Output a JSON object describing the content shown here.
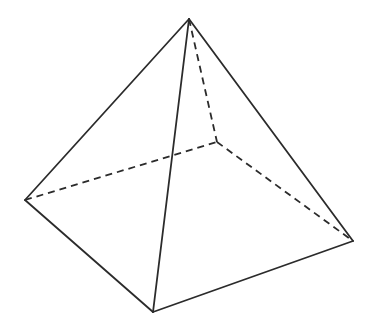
{
  "diagram": {
    "stroke_color": "#2b2b2b",
    "background": "#ffffff",
    "vertices": {
      "apex": [
        189,
        19
      ],
      "left": [
        25,
        200
      ],
      "front": [
        153,
        312
      ],
      "right": [
        353,
        241
      ],
      "back": [
        217,
        142
      ]
    },
    "visible_edges": [
      [
        "apex",
        "left"
      ],
      [
        "apex",
        "front"
      ],
      [
        "apex",
        "right"
      ],
      [
        "left",
        "front"
      ],
      [
        "front",
        "right"
      ]
    ],
    "hidden_edges": [
      [
        "apex",
        "back"
      ],
      [
        "left",
        "back"
      ],
      [
        "back",
        "right"
      ]
    ]
  }
}
